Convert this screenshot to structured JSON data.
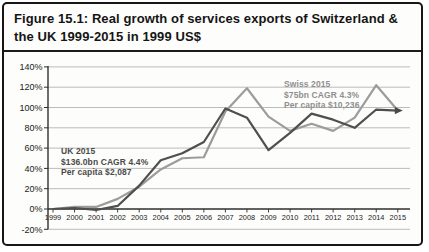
{
  "figure": {
    "title": "Figure 15.1: Real growth of services exports of Switzerland & the UK 1999-2015 in 1999 US$",
    "title_line1": "Figure 15.1: Real growth of services exports of Switzerland &",
    "title_line2": "the UK 1999-2015 in 1999 US$"
  },
  "chart_data": {
    "type": "line",
    "title": "Figure 15.1: Real growth of services exports of Switzerland & the UK 1999-2015 in 1999 US$",
    "x": [
      1999,
      2000,
      2001,
      2002,
      2003,
      2004,
      2005,
      2006,
      2007,
      2008,
      2009,
      2010,
      2011,
      2012,
      2013,
      2014,
      2015
    ],
    "x_tick_labels": [
      "1999",
      "2000",
      "2001",
      "2002",
      "2003",
      "2004",
      "2005",
      "2006",
      "2007",
      "2008",
      "2009",
      "2010",
      "2011",
      "2012",
      "2013",
      "2014",
      "2015"
    ],
    "y_tick_labels": [
      "140%",
      "120%",
      "100%",
      "80%",
      "60%",
      "40%",
      "20%",
      "0%",
      "-20%"
    ],
    "y_tick_values": [
      140,
      120,
      100,
      80,
      60,
      40,
      20,
      0,
      -20
    ],
    "ylim": [
      -20,
      140
    ],
    "ylabel": "Real growth (%)",
    "xlabel": "Year",
    "grid": true,
    "legend_position": "none",
    "series": [
      {
        "name": "UK",
        "color": "#4f4f4f",
        "values": [
          0,
          1,
          -1,
          3,
          23,
          48,
          55,
          66,
          99,
          90,
          58,
          75,
          94,
          88,
          80,
          98,
          97
        ],
        "annotation": {
          "lines": [
            "UK 2015",
            "$136.0bn CAGR 4.4%",
            "Per capita $2,087"
          ]
        }
      },
      {
        "name": "Swiss",
        "color": "#9c9c9c",
        "values": [
          0,
          2,
          2,
          10,
          22,
          39,
          50,
          51,
          96,
          119,
          91,
          77,
          84,
          77,
          90,
          122,
          97
        ],
        "annotation": {
          "lines": [
            "Swiss 2015",
            "$75bn CAGR 4.3%",
            "Per capita $10,236"
          ]
        }
      }
    ],
    "colors": {
      "axis": "#2e2e2e",
      "gridline": "#b4b4b4",
      "border": "#161616",
      "endpoint_marker": "#4a4a4a"
    }
  }
}
